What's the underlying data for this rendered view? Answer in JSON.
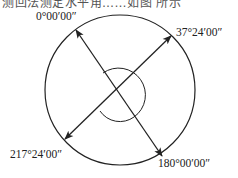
{
  "header": {
    "clipped_text": "测回法测定水平角……如图 所示"
  },
  "diagram": {
    "type": "horizontal-circle-bearing-diagram",
    "circle": {
      "cx": 120,
      "cy": 90,
      "r": 75,
      "stroke": "#222222"
    },
    "labels": {
      "top_left": "0°00′00″",
      "top_right": "37°24′00″",
      "bottom_left": "217°24′00″",
      "bottom_right": "180°00′00″"
    },
    "directions": [
      {
        "name": "0°00′00″",
        "arrow_at": [
          76,
          30
        ]
      },
      {
        "name": "37°24′00″",
        "arrow_at": [
          171,
          36
        ]
      },
      {
        "name": "180°00′00″",
        "arrow_at": [
          162,
          156
        ]
      },
      {
        "name": "217°24′00″",
        "arrow_at": [
          65,
          139
        ]
      }
    ]
  }
}
